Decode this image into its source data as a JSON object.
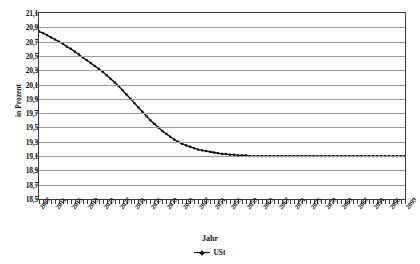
{
  "chart_data": {
    "type": "line",
    "title": "",
    "xlabel": "Jahr",
    "ylabel": "in Prozent",
    "ylim": [
      18.5,
      21.1
    ],
    "ytick_step": 0.2,
    "grid": true,
    "legend_position": "bottom",
    "legend": [
      "USt"
    ],
    "series": [
      {
        "name": "USt",
        "marker": "small-square",
        "color": "#111111",
        "x": [
          2007,
          2008,
          2009,
          2010,
          2011,
          2012,
          2013,
          2014,
          2015,
          2016,
          2017,
          2018,
          2019,
          2020,
          2021,
          2022,
          2023,
          2024,
          2025,
          2026,
          2027,
          2028,
          2029,
          2030,
          2031,
          2032,
          2033,
          2034,
          2035,
          2036,
          2037,
          2038,
          2039,
          2040,
          2041,
          2042,
          2043,
          2044,
          2045,
          2046,
          2047,
          2048,
          2049,
          2050,
          2051,
          2052,
          2053,
          2054,
          2055,
          2056,
          2057,
          2058,
          2059,
          2060,
          2061,
          2062,
          2063,
          2064,
          2065,
          2066,
          2067,
          2068,
          2069,
          2070,
          2071,
          2072,
          2073,
          2074,
          2075,
          2076,
          2077,
          2078,
          2079,
          2080,
          2081,
          2082,
          2083,
          2084,
          2085,
          2086,
          2087,
          2088,
          2089,
          2090,
          2091,
          2092,
          2093,
          2094,
          2095,
          2096,
          2097,
          2098,
          2099
        ],
        "values": [
          20.84,
          20.82,
          20.79,
          20.76,
          20.73,
          20.7,
          20.67,
          20.63,
          20.6,
          20.56,
          20.52,
          20.48,
          20.44,
          20.4,
          20.36,
          20.32,
          20.28,
          20.23,
          20.18,
          20.13,
          20.08,
          20.02,
          19.96,
          19.9,
          19.84,
          19.78,
          19.72,
          19.66,
          19.6,
          19.55,
          19.5,
          19.45,
          19.41,
          19.37,
          19.33,
          19.3,
          19.27,
          19.25,
          19.23,
          19.21,
          19.19,
          19.18,
          19.17,
          19.16,
          19.15,
          19.14,
          19.13,
          19.13,
          19.12,
          19.12,
          19.11,
          19.11,
          19.11,
          19.1,
          19.1,
          19.1,
          19.1,
          19.1,
          19.1,
          19.1,
          19.1,
          19.1,
          19.1,
          19.1,
          19.1,
          19.1,
          19.1,
          19.1,
          19.1,
          19.1,
          19.1,
          19.1,
          19.1,
          19.1,
          19.1,
          19.1,
          19.1,
          19.1,
          19.1,
          19.1,
          19.1,
          19.1,
          19.1,
          19.1,
          19.1,
          19.1,
          19.1,
          19.1,
          19.1,
          19.1,
          19.1,
          19.1,
          19.1
        ]
      }
    ],
    "ytick_labels": [
      "21,1",
      "20,9",
      "20,7",
      "20,5",
      "20,3",
      "20,1",
      "19,9",
      "19,7",
      "19,5",
      "19,3",
      "19,1",
      "18,9",
      "18,7",
      "18,5"
    ],
    "ytick_values": [
      21.1,
      20.9,
      20.7,
      20.5,
      20.3,
      20.1,
      19.9,
      19.7,
      19.5,
      19.3,
      19.1,
      18.9,
      18.7,
      18.5
    ],
    "xtick_labels": [
      "2007",
      "2011",
      "2015",
      "2019",
      "2023",
      "2027",
      "2031",
      "2035",
      "2039",
      "2043",
      "2047",
      "2051",
      "2055",
      "2059",
      "2063",
      "2067",
      "2071",
      "2075",
      "2079",
      "2083",
      "2087",
      "2091",
      "2095",
      "2099"
    ],
    "xtick_values": [
      2007,
      2011,
      2015,
      2019,
      2023,
      2027,
      2031,
      2035,
      2039,
      2043,
      2047,
      2051,
      2055,
      2059,
      2063,
      2067,
      2071,
      2075,
      2079,
      2083,
      2087,
      2091,
      2095,
      2099
    ],
    "xlim": [
      2007,
      2099
    ]
  }
}
